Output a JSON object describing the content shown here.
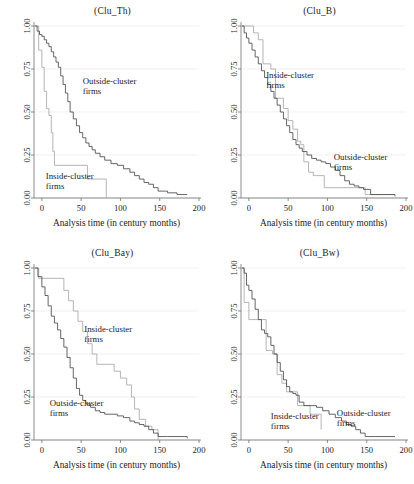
{
  "figure": {
    "panel_count": 4,
    "xlabel": "Analysis time (in century months)",
    "x_ticks": [
      "0",
      "50",
      "100",
      "150",
      "200"
    ],
    "y_ticks": [
      "0.00",
      "0.25",
      "0.50",
      "0.75",
      "1.00"
    ],
    "series_names": [
      "Outside-cluster firms",
      "Inside-cluster firms"
    ],
    "colors": {
      "outside": "#4a4a4a",
      "inside": "#a8a8a8",
      "axis": "#6e6e6e",
      "grid": "#e9e9e9"
    }
  },
  "chart_data": [
    {
      "type": "line",
      "title": "(Clu_Th)",
      "xlabel": "Analysis time (in century months)",
      "ylabel": "",
      "xlim": [
        -10,
        200
      ],
      "ylim": [
        0,
        1
      ],
      "grid": true,
      "legend": "inline-annotation",
      "annotations": [
        {
          "text": "Outside-cluster firms",
          "x": 52,
          "y": 0.66
        },
        {
          "text": "Inside-cluster firms",
          "x": 5,
          "y": 0.11
        }
      ],
      "series": [
        {
          "name": "Outside-cluster firms",
          "step": "post",
          "x": [
            -9,
            -6,
            -3,
            0,
            3,
            6,
            9,
            12,
            15,
            18,
            21,
            24,
            27,
            30,
            33,
            36,
            40,
            44,
            48,
            52,
            56,
            60,
            64,
            68,
            74,
            80,
            88,
            96,
            104,
            112,
            118,
            124,
            130,
            136,
            142,
            148,
            160,
            172,
            185
          ],
          "y": [
            1.0,
            0.97,
            0.95,
            0.94,
            0.92,
            0.9,
            0.88,
            0.85,
            0.82,
            0.79,
            0.76,
            0.71,
            0.66,
            0.61,
            0.56,
            0.5,
            0.46,
            0.42,
            0.38,
            0.35,
            0.32,
            0.3,
            0.28,
            0.26,
            0.24,
            0.22,
            0.2,
            0.19,
            0.17,
            0.15,
            0.13,
            0.11,
            0.09,
            0.08,
            0.06,
            0.04,
            0.03,
            0.02,
            0.02
          ]
        },
        {
          "name": "Inside-cluster firms",
          "step": "post",
          "x": [
            -9,
            -4,
            0,
            3,
            6,
            9,
            12,
            14,
            16,
            58,
            82
          ],
          "y": [
            1.0,
            0.86,
            0.76,
            0.62,
            0.52,
            0.48,
            0.38,
            0.27,
            0.19,
            0.11,
            0.0
          ]
        }
      ]
    },
    {
      "type": "line",
      "title": "(Clu_B)",
      "xlabel": "Analysis time (in century months)",
      "ylabel": "",
      "xlim": [
        -10,
        200
      ],
      "ylim": [
        0,
        1
      ],
      "grid": true,
      "legend": "inline-annotation",
      "annotations": [
        {
          "text": "Inside-cluster firms",
          "x": 22,
          "y": 0.7
        },
        {
          "text": "Outside-cluster firms",
          "x": 108,
          "y": 0.22
        }
      ],
      "series": [
        {
          "name": "Outside-cluster firms",
          "step": "post",
          "x": [
            -9,
            -6,
            -3,
            0,
            4,
            8,
            12,
            16,
            20,
            24,
            28,
            32,
            36,
            40,
            44,
            48,
            52,
            56,
            60,
            64,
            68,
            74,
            80,
            86,
            92,
            98,
            104,
            110,
            116,
            122,
            128,
            134,
            140,
            146,
            155,
            170,
            186
          ],
          "y": [
            1.0,
            0.96,
            0.93,
            0.9,
            0.86,
            0.82,
            0.78,
            0.74,
            0.7,
            0.66,
            0.62,
            0.58,
            0.54,
            0.5,
            0.46,
            0.42,
            0.38,
            0.34,
            0.31,
            0.29,
            0.27,
            0.25,
            0.23,
            0.22,
            0.21,
            0.2,
            0.18,
            0.16,
            0.13,
            0.1,
            0.08,
            0.07,
            0.06,
            0.05,
            0.02,
            0.02,
            0.01
          ]
        },
        {
          "name": "Inside-cluster firms",
          "step": "post",
          "x": [
            -9,
            0,
            6,
            12,
            18,
            28,
            34,
            44,
            50,
            56,
            62,
            66,
            70,
            76,
            82,
            96,
            120,
            148,
            186
          ],
          "y": [
            1.0,
            1.0,
            0.96,
            0.92,
            0.78,
            0.75,
            0.58,
            0.52,
            0.45,
            0.4,
            0.33,
            0.31,
            0.21,
            0.15,
            0.13,
            0.06,
            0.06,
            0.02,
            0.02
          ]
        }
      ]
    },
    {
      "type": "line",
      "title": "(Clu_Bay)",
      "xlabel": "Analysis time (in century months)",
      "ylabel": "",
      "xlim": [
        -10,
        200
      ],
      "ylim": [
        0,
        1
      ],
      "grid": true,
      "legend": "inline-annotation",
      "annotations": [
        {
          "text": "Inside-cluster firms",
          "x": 54,
          "y": 0.63
        },
        {
          "text": "Outside-cluster firms",
          "x": 10,
          "y": 0.2
        }
      ],
      "series": [
        {
          "name": "Outside-cluster firms",
          "step": "post",
          "x": [
            -9,
            -5,
            0,
            4,
            8,
            12,
            16,
            20,
            24,
            28,
            32,
            36,
            40,
            44,
            48,
            52,
            56,
            62,
            68,
            74,
            80,
            88,
            96,
            104,
            112,
            118,
            124,
            130,
            136,
            142,
            148,
            160,
            172,
            185
          ],
          "y": [
            1.0,
            0.95,
            0.89,
            0.84,
            0.78,
            0.72,
            0.68,
            0.64,
            0.59,
            0.54,
            0.48,
            0.42,
            0.36,
            0.3,
            0.26,
            0.23,
            0.21,
            0.19,
            0.17,
            0.16,
            0.15,
            0.15,
            0.14,
            0.13,
            0.11,
            0.1,
            0.09,
            0.08,
            0.06,
            0.04,
            0.02,
            0.02,
            0.02,
            0.01
          ]
        },
        {
          "name": "Inside-cluster firms",
          "step": "post",
          "x": [
            -9,
            -4,
            0,
            20,
            28,
            34,
            40,
            46,
            52,
            58,
            64,
            70,
            82,
            92,
            100,
            108,
            114,
            118,
            124,
            132,
            140,
            148
          ],
          "y": [
            1.0,
            0.94,
            0.94,
            0.94,
            0.87,
            0.81,
            0.75,
            0.69,
            0.63,
            0.56,
            0.5,
            0.44,
            0.44,
            0.4,
            0.36,
            0.32,
            0.25,
            0.18,
            0.12,
            0.08,
            0.06,
            0.0
          ]
        }
      ]
    },
    {
      "type": "line",
      "title": "(Clu_Bw)",
      "xlabel": "Analysis time (in century months)",
      "ylabel": "",
      "xlim": [
        -10,
        200
      ],
      "ylim": [
        0,
        1
      ],
      "grid": true,
      "legend": "inline-annotation",
      "annotations": [
        {
          "text": "Inside-cluster firms",
          "x": 28,
          "y": 0.12
        },
        {
          "text": "Outside-cluster firms",
          "x": 112,
          "y": 0.14
        }
      ],
      "series": [
        {
          "name": "Outside-cluster firms",
          "step": "post",
          "x": [
            -9,
            -6,
            -3,
            0,
            4,
            8,
            12,
            16,
            20,
            24,
            28,
            32,
            36,
            40,
            44,
            48,
            52,
            56,
            60,
            64,
            70,
            78,
            86,
            94,
            102,
            110,
            118,
            124,
            130,
            136,
            142,
            148,
            160,
            172,
            186
          ],
          "y": [
            1.0,
            0.97,
            0.9,
            0.87,
            0.82,
            0.76,
            0.7,
            0.64,
            0.62,
            0.6,
            0.55,
            0.5,
            0.45,
            0.4,
            0.35,
            0.31,
            0.28,
            0.27,
            0.26,
            0.22,
            0.2,
            0.2,
            0.19,
            0.17,
            0.15,
            0.13,
            0.11,
            0.09,
            0.08,
            0.06,
            0.04,
            0.02,
            0.02,
            0.02,
            0.02
          ]
        },
        {
          "name": "Inside-cluster firms",
          "step": "post",
          "x": [
            -9,
            -6,
            0,
            14,
            22,
            30,
            36,
            42,
            48,
            56,
            62,
            68,
            78,
            92
          ],
          "y": [
            1.0,
            0.8,
            0.7,
            0.7,
            0.52,
            0.5,
            0.38,
            0.33,
            0.28,
            0.28,
            0.2,
            0.2,
            0.15,
            0.06
          ]
        }
      ]
    }
  ]
}
